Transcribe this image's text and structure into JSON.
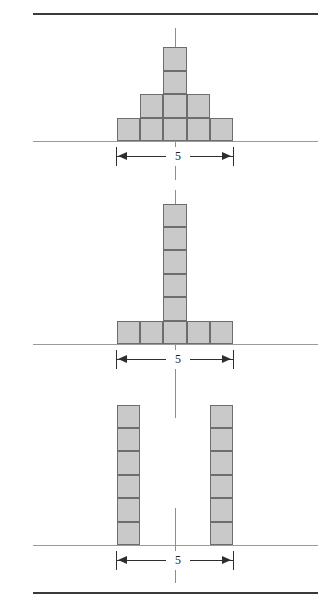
{
  "figure": {
    "unit_label": "5",
    "colors": {
      "block_fill": "#c9c9c9",
      "block_stroke": "#6d6d6d",
      "ground_line": "#9a9a9a",
      "center_line": "#8d8d8d",
      "border_rule": "#3a3a3a",
      "dimension": "#2e2e2e",
      "background": "#ffffff"
    },
    "rules": [
      {
        "name": "top-rule",
        "x": 33,
        "y": 13,
        "width": 285
      },
      {
        "name": "bottom-rule",
        "x": 33,
        "y": 592,
        "width": 285
      }
    ],
    "panels": [
      {
        "id": "panel-1",
        "name": "pyramid-stack",
        "shape": "pyramid",
        "ground_y": 141,
        "ground_x": 33,
        "ground_width": 285,
        "center_x": 175,
        "centerline": {
          "y": 28,
          "height": 152
        },
        "block_size": 23.4,
        "rows": [
          {
            "row": "base",
            "count": 5,
            "blocks_from_center": -2.5
          },
          {
            "row": "middle",
            "count": 3,
            "blocks_from_center": -1.5
          },
          {
            "row": "upper",
            "count": 1,
            "blocks_from_center": -0.5
          },
          {
            "row": "top",
            "count": 1,
            "blocks_from_center": -0.5
          }
        ],
        "total_blocks": 10,
        "height_in_blocks": 4,
        "width_in_blocks": 5,
        "dimension": {
          "label": "5",
          "x_left": 116,
          "x_right": 233,
          "y": 147,
          "spans_blocks": 5
        }
      },
      {
        "id": "panel-2",
        "name": "tee-stack",
        "shape": "T-shape",
        "ground_y": 344,
        "ground_x": 33,
        "ground_width": 285,
        "center_x": 175,
        "centerline": {
          "y": 190,
          "height": 192
        },
        "block_size": 23.4,
        "rows": [
          {
            "row": "base",
            "count": 5,
            "blocks_from_center": -2.5
          },
          {
            "row": "column-1",
            "count": 1,
            "blocks_from_center": -0.5
          },
          {
            "row": "column-2",
            "count": 1,
            "blocks_from_center": -0.5
          },
          {
            "row": "column-3",
            "count": 1,
            "blocks_from_center": -0.5
          },
          {
            "row": "column-4",
            "count": 1,
            "blocks_from_center": -0.5
          },
          {
            "row": "column-5",
            "count": 1,
            "blocks_from_center": -0.5
          }
        ],
        "total_blocks": 10,
        "height_in_blocks": 6,
        "width_in_blocks": 5,
        "dimension": {
          "label": "5",
          "x_left": 116,
          "x_right": 233,
          "y": 350,
          "spans_blocks": 5
        }
      },
      {
        "id": "panel-3",
        "name": "twin-columns-stack",
        "shape": "two separated columns",
        "ground_y": 545,
        "ground_x": 33,
        "ground_width": 285,
        "center_x": 175,
        "centerline_segments": [
          {
            "y": 370,
            "height": 48
          },
          {
            "y": 508,
            "height": 75
          }
        ],
        "block_size": 23.4,
        "columns": [
          {
            "column": "left",
            "count": 6,
            "blocks_from_center": -2.5
          },
          {
            "column": "right",
            "count": 6,
            "blocks_from_center": 1.5
          }
        ],
        "total_blocks": 12,
        "height_in_blocks": 6,
        "width_in_blocks": 5,
        "dimension": {
          "label": "5",
          "x_left": 116,
          "x_right": 233,
          "y": 551,
          "spans_blocks": 5
        }
      }
    ]
  }
}
